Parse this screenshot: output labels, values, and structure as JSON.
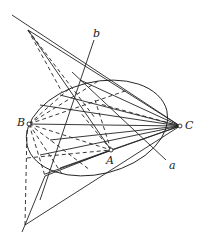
{
  "diagram": {
    "type": "projective-geometry-construction",
    "labels": {
      "A": "A",
      "B": "B",
      "C": "C",
      "a": "a",
      "b": "b"
    },
    "points": {
      "B": [
        29,
        124
      ],
      "C": [
        180,
        126
      ],
      "A": [
        111,
        150
      ],
      "top_apex": [
        28,
        30
      ],
      "bottom_apex": [
        25,
        225
      ]
    },
    "colors": {
      "stroke": "#222222",
      "background": "#ffffff"
    }
  }
}
